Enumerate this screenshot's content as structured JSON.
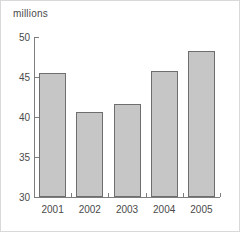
{
  "chart_data": {
    "type": "bar",
    "title": "",
    "subtitle": "",
    "unit_label": "millions",
    "xlabel": "",
    "ylabel": "millions",
    "categories": [
      "2001",
      "2002",
      "2003",
      "2004",
      "2005"
    ],
    "values": [
      45.5,
      40.6,
      41.6,
      45.7,
      48.2
    ],
    "series": [
      {
        "name": "millions",
        "values": [
          45.5,
          40.6,
          41.6,
          45.7,
          48.2
        ]
      }
    ],
    "ylim": [
      30,
      50
    ],
    "y_ticks": [
      30,
      35,
      40,
      45,
      50
    ],
    "y_tick_labels": [
      "30",
      "35",
      "40",
      "45",
      "50"
    ],
    "x_tick_labels": [
      "2001",
      "2002",
      "2003",
      "2004",
      "2005"
    ],
    "grid": false,
    "legend": false,
    "legend_position": "none",
    "bar_fill_color": "#c6c6c6",
    "bar_edge_color": "#6e6e6e",
    "axis_color": "#7d7d7d",
    "text_color": "#4a4a4a",
    "background_color": "#ffffff"
  }
}
